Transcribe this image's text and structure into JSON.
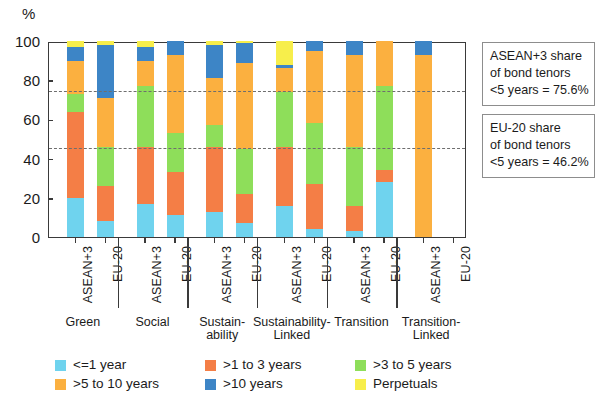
{
  "chart_data": {
    "type": "bar",
    "subtype": "stacked-percent",
    "title": "",
    "xlabel": "",
    "ylabel": "%",
    "ylim": [
      0,
      100
    ],
    "yticks": [
      0,
      20,
      40,
      60,
      80,
      100
    ],
    "grid": false,
    "legend_position": "bottom",
    "categories": [
      "Green ASEAN+3",
      "Green EU-20",
      "Social ASEAN+3",
      "Social EU-20",
      "Sustainability ASEAN+3",
      "Sustainability EU-20",
      "Sustainability-Linked ASEAN+3",
      "Sustainability-Linked EU-20",
      "Transition ASEAN+3",
      "Transition EU-20",
      "Transition-Linked ASEAN+3",
      "Transition-Linked EU-20"
    ],
    "groups": [
      {
        "label": "Green",
        "bars": [
          "ASEAN+3",
          "EU-20"
        ]
      },
      {
        "label": "Social",
        "bars": [
          "ASEAN+3",
          "EU-20"
        ]
      },
      {
        "label": "Sustain-\nability",
        "bars": [
          "ASEAN+3",
          "EU-20"
        ]
      },
      {
        "label": "Sustainability-\nLinked",
        "bars": [
          "ASEAN+3",
          "EU-20"
        ]
      },
      {
        "label": "Transition",
        "bars": [
          "ASEAN+3",
          "EU-20"
        ]
      },
      {
        "label": "Transition-\nLinked",
        "bars": [
          "ASEAN+3",
          "EU-20"
        ]
      }
    ],
    "series": [
      {
        "name": "<=1 year",
        "color": "#6fd3ee",
        "values": [
          20,
          8,
          17,
          11,
          13,
          7,
          16,
          4,
          3,
          28,
          0,
          0
        ]
      },
      {
        "name": ">1 to 3 years",
        "color": "#f47e46",
        "values": [
          44,
          18,
          29,
          22,
          33,
          15,
          30,
          23,
          13,
          6,
          0,
          0
        ]
      },
      {
        "name": ">3 to 5 years",
        "color": "#8ede5a",
        "values": [
          9,
          20,
          31,
          20,
          11,
          23,
          28,
          31,
          30,
          43,
          0,
          0
        ]
      },
      {
        "name": ">5 to 10 years",
        "color": "#fbb040",
        "values": [
          17,
          25,
          13,
          40,
          24,
          44,
          12,
          37,
          47,
          23,
          93,
          0
        ]
      },
      {
        "name": ">10 years",
        "color": "#3d85c6",
        "values": [
          7,
          27,
          7,
          7,
          17,
          10,
          2,
          5,
          7,
          0,
          7,
          0
        ]
      },
      {
        "name": "Perpetuals",
        "color": "#f7ee4b",
        "values": [
          3,
          2,
          3,
          0,
          2,
          1,
          12,
          0,
          0,
          0,
          0,
          0
        ]
      }
    ],
    "reference_lines": [
      {
        "value": 75.6,
        "label": "ASEAN+3 share of bond tenors <5 years = 75.6%",
        "style": "dashed"
      },
      {
        "value": 46.2,
        "label": "EU-20 share of bond tenors <5 years = 46.2%",
        "style": "dashed"
      }
    ],
    "annotations": [
      {
        "lines": [
          "ASEAN+3 share",
          "of bond tenors",
          "<5 years = 75.6%"
        ]
      },
      {
        "lines": [
          "EU-20 share",
          "of bond tenors",
          "<5 years = 46.2%"
        ]
      }
    ]
  },
  "axis": {
    "y_unit": "%",
    "tick_labels": [
      "100",
      "80",
      "60",
      "40",
      "20",
      "0"
    ]
  },
  "legend": {
    "items": [
      {
        "label": "<=1 year",
        "color": "#6fd3ee"
      },
      {
        "label": ">1 to 3 years",
        "color": "#f47e46"
      },
      {
        "label": ">3 to 5 years",
        "color": "#8ede5a"
      },
      {
        "label": ">5 to 10 years",
        "color": "#fbb040"
      },
      {
        "label": ">10 years",
        "color": "#3d85c6"
      },
      {
        "label": "Perpetuals",
        "color": "#f7ee4b"
      }
    ]
  }
}
